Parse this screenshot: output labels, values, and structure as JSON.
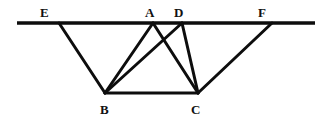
{
  "figure": {
    "canvas": {
      "width": 326,
      "height": 124
    },
    "background_color": "#ffffff",
    "stroke_color": "#0d0d0d",
    "label_color": "#111111",
    "stroke_width_main": 3.0,
    "stroke_width_ground": 3.4,
    "points": {
      "E": {
        "x": 59,
        "y": 23,
        "label": "E",
        "label_x": 40,
        "label_y": 6
      },
      "A": {
        "x": 153,
        "y": 23,
        "label": "A",
        "label_x": 145,
        "label_y": 6
      },
      "D": {
        "x": 182,
        "y": 23,
        "label": "D",
        "label_x": 174,
        "label_y": 6
      },
      "F": {
        "x": 272,
        "y": 23,
        "label": "F",
        "label_x": 258,
        "label_y": 6
      },
      "B": {
        "x": 105,
        "y": 93,
        "label": "B",
        "label_x": 100,
        "label_y": 103
      },
      "C": {
        "x": 198,
        "y": 93,
        "label": "C",
        "label_x": 191,
        "label_y": 103
      }
    },
    "ground_line": {
      "x1": 17,
      "y1": 23,
      "x2": 315,
      "y2": 23,
      "name": "horizontal-ground-line"
    },
    "segments": [
      {
        "name": "segment-EB",
        "from": "E",
        "to": "B"
      },
      {
        "name": "segment-AB",
        "from": "A",
        "to": "B"
      },
      {
        "name": "segment-AC",
        "from": "A",
        "to": "C"
      },
      {
        "name": "segment-DB",
        "from": "D",
        "to": "B"
      },
      {
        "name": "segment-DC",
        "from": "D",
        "to": "C"
      },
      {
        "name": "segment-BC",
        "from": "B",
        "to": "C"
      },
      {
        "name": "segment-FC",
        "from": "F",
        "to": "C"
      }
    ],
    "labels_order": [
      "E",
      "A",
      "D",
      "F",
      "B",
      "C"
    ]
  }
}
